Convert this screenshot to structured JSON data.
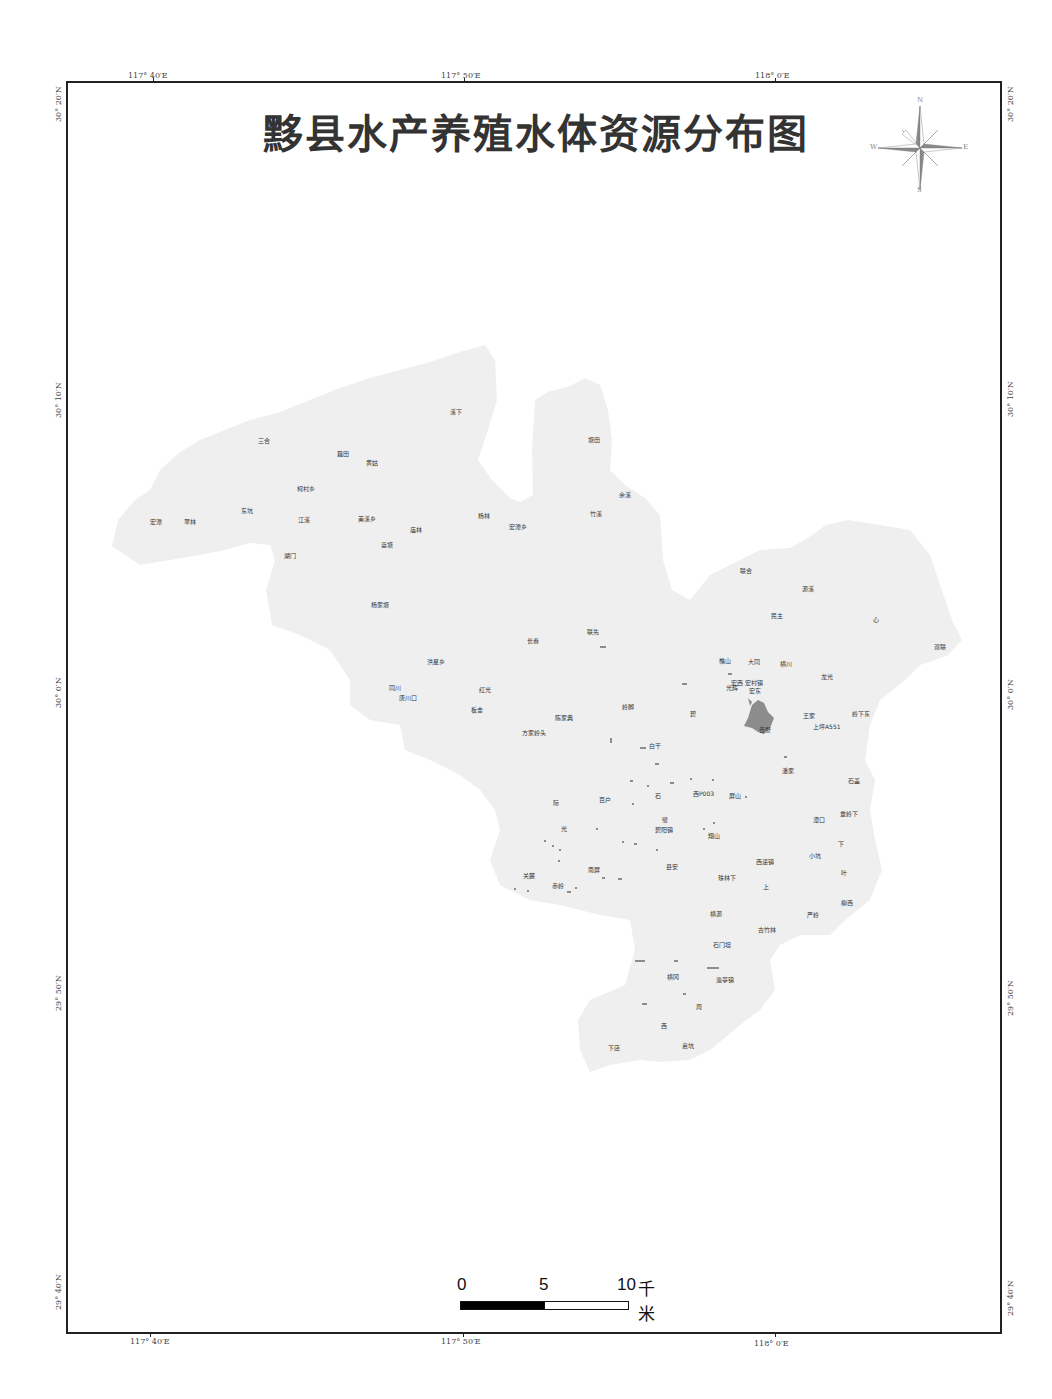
{
  "title": "黟县水产养殖水体资源分布图",
  "graticule": {
    "top": [
      "117° 40′E",
      "117° 50′E",
      "118° 0′E"
    ],
    "bottom": [
      "117° 40′E",
      "117° 50′E",
      "118° 0′E"
    ],
    "left": [
      "30° 20′N",
      "30° 10′N",
      "30° 0′N",
      "29° 50′N",
      "29° 40′N"
    ],
    "right": [
      "30° 20′N",
      "30° 10′N",
      "30° 0′N",
      "29° 50′N",
      "29° 40′N"
    ]
  },
  "compass": {
    "n": "N",
    "s": "S",
    "e": "E",
    "w": "W",
    "fill": "#8a8a8a"
  },
  "scale_bar": {
    "labels": [
      "0",
      "5",
      "10"
    ],
    "unit": "千米"
  },
  "colors": {
    "land": "#efefef",
    "water": "#8c8c8c",
    "frame": "#222222"
  },
  "places": [
    {
      "name": "三合",
      "x": 258,
      "y": 440
    },
    {
      "name": "藕田",
      "x": 337,
      "y": 453
    },
    {
      "name": "黄姑",
      "x": 366,
      "y": 462
    },
    {
      "name": "柯村乡",
      "x": 297,
      "y": 488
    },
    {
      "name": "东坑",
      "x": 241,
      "y": 510
    },
    {
      "name": "宏潭",
      "x": 150,
      "y": 521
    },
    {
      "name": "翠林",
      "x": 184,
      "y": 521
    },
    {
      "name": "江溪",
      "x": 298,
      "y": 519
    },
    {
      "name": "美溪乡",
      "x": 358,
      "y": 518
    },
    {
      "name": "庙林",
      "x": 410,
      "y": 529
    },
    {
      "name": "蓝塘",
      "x": 381,
      "y": 544
    },
    {
      "name": "湖门",
      "x": 284,
      "y": 555
    },
    {
      "name": "溪下",
      "x": 450,
      "y": 411
    },
    {
      "name": "塘田",
      "x": 588,
      "y": 439
    },
    {
      "name": "余溪",
      "x": 619,
      "y": 494
    },
    {
      "name": "竹溪",
      "x": 590,
      "y": 513
    },
    {
      "name": "杨林",
      "x": 478,
      "y": 515
    },
    {
      "name": "宏潭乡",
      "x": 509,
      "y": 526
    },
    {
      "name": "联合",
      "x": 740,
      "y": 570
    },
    {
      "name": "源溪",
      "x": 802,
      "y": 588
    },
    {
      "name": "民主",
      "x": 771,
      "y": 615
    },
    {
      "name": "心",
      "x": 873,
      "y": 619
    },
    {
      "name": "双联",
      "x": 934,
      "y": 646
    },
    {
      "name": "樵山",
      "x": 719,
      "y": 660
    },
    {
      "name": "大同",
      "x": 748,
      "y": 661
    },
    {
      "name": "横川",
      "x": 780,
      "y": 663
    },
    {
      "name": "龙光",
      "x": 821,
      "y": 676
    },
    {
      "name": "宏西",
      "x": 731,
      "y": 682
    },
    {
      "name": "宏村镇",
      "x": 745,
      "y": 682
    },
    {
      "name": "光辉",
      "x": 726,
      "y": 687
    },
    {
      "name": "宏东",
      "x": 749,
      "y": 690
    },
    {
      "name": "王家",
      "x": 803,
      "y": 715
    },
    {
      "name": "岭下东",
      "x": 852,
      "y": 713
    },
    {
      "name": "上坪A551",
      "x": 813,
      "y": 726
    },
    {
      "name": "奇墅",
      "x": 759,
      "y": 729
    },
    {
      "name": "杨家塘",
      "x": 371,
      "y": 604
    },
    {
      "name": "长春",
      "x": 527,
      "y": 640
    },
    {
      "name": "联先",
      "x": 587,
      "y": 631
    },
    {
      "name": "洪星乡",
      "x": 427,
      "y": 661
    },
    {
      "name": "同川",
      "x": 389,
      "y": 687
    },
    {
      "name": "唐川口",
      "x": 399,
      "y": 697
    },
    {
      "name": "红光",
      "x": 479,
      "y": 689
    },
    {
      "name": "板舍",
      "x": 471,
      "y": 709
    },
    {
      "name": "陈家典",
      "x": 555,
      "y": 717
    },
    {
      "name": "方家岭头",
      "x": 522,
      "y": 732
    },
    {
      "name": "岭脚",
      "x": 622,
      "y": 706
    },
    {
      "name": "碧",
      "x": 690,
      "y": 713
    },
    {
      "name": "白干",
      "x": 649,
      "y": 745
    },
    {
      "name": "潘家",
      "x": 782,
      "y": 770
    },
    {
      "name": "石盖",
      "x": 848,
      "y": 780
    },
    {
      "name": "西P003",
      "x": 693,
      "y": 793
    },
    {
      "name": "屏山",
      "x": 729,
      "y": 795
    },
    {
      "name": "石",
      "x": 655,
      "y": 795
    },
    {
      "name": "百户",
      "x": 599,
      "y": 799
    },
    {
      "name": "际",
      "x": 553,
      "y": 802
    },
    {
      "name": "章岭下",
      "x": 840,
      "y": 813
    },
    {
      "name": "漳口",
      "x": 813,
      "y": 819
    },
    {
      "name": "璧",
      "x": 662,
      "y": 819
    },
    {
      "name": "碧阳镇",
      "x": 655,
      "y": 829
    },
    {
      "name": "光",
      "x": 561,
      "y": 828
    },
    {
      "name": "翔山",
      "x": 708,
      "y": 835
    },
    {
      "name": "下",
      "x": 838,
      "y": 843
    },
    {
      "name": "小坑",
      "x": 809,
      "y": 855
    },
    {
      "name": "西递镇",
      "x": 756,
      "y": 861
    },
    {
      "name": "南屏",
      "x": 588,
      "y": 869
    },
    {
      "name": "县安",
      "x": 666,
      "y": 866
    },
    {
      "name": "叶",
      "x": 841,
      "y": 872
    },
    {
      "name": "关麓",
      "x": 523,
      "y": 875
    },
    {
      "name": "珠林下",
      "x": 718,
      "y": 877
    },
    {
      "name": "赤岭",
      "x": 552,
      "y": 885
    },
    {
      "name": "上",
      "x": 763,
      "y": 886
    },
    {
      "name": "柳西",
      "x": 841,
      "y": 902
    },
    {
      "name": "横源",
      "x": 710,
      "y": 913
    },
    {
      "name": "严岭",
      "x": 807,
      "y": 914
    },
    {
      "name": "古竹林",
      "x": 758,
      "y": 929
    },
    {
      "name": "石门坦",
      "x": 713,
      "y": 944
    },
    {
      "name": "横冈",
      "x": 667,
      "y": 976
    },
    {
      "name": "渔亭镇",
      "x": 716,
      "y": 979
    },
    {
      "name": "周",
      "x": 696,
      "y": 1006
    },
    {
      "name": "西",
      "x": 661,
      "y": 1025
    },
    {
      "name": "下店",
      "x": 608,
      "y": 1047
    },
    {
      "name": "嘉坑",
      "x": 682,
      "y": 1045
    }
  ]
}
